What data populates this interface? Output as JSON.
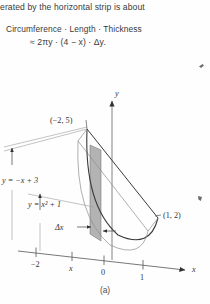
{
  "page": {
    "caption": "(a)",
    "background_color": "#fefefe",
    "ink_color": "#333333"
  },
  "text_block": {
    "line1": "erated by the horizontal strip is about",
    "formula_words": "Circumference · Length · Thickness",
    "formula_math": "≈ 2πy · (4 − x) · Δy."
  },
  "figure": {
    "type": "solid-of-revolution-diagram",
    "axes": {
      "x_axis_label": "x",
      "y_axis_label": "y",
      "x_ticks": [
        "−2",
        "x",
        "0",
        "1"
      ]
    },
    "curve_labels": {
      "line": "y = −x + 3",
      "parabola": "y = x² + 1"
    },
    "points": {
      "intersection_upper": "(−2, 5)",
      "intersection_lower": "(1, 2)"
    },
    "annotations": {
      "delta_x": "Δx"
    },
    "strip": {
      "fill_color": "#9a9a9a",
      "description": "vertical shaded strip between the parabola and the line"
    }
  },
  "colors": {
    "ink": "#333333",
    "light_ink": "#8d8d8d",
    "strip_fill": "#9a9a9a",
    "paper": "#fefefe"
  }
}
